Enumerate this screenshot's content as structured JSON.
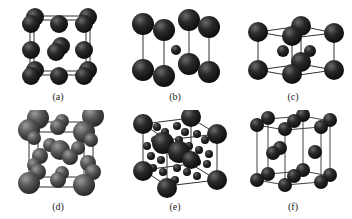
{
  "figure": {
    "panels": [
      {
        "id": "a",
        "label": "(a)",
        "structure": "simple-cubic-like (3x3 sphere grid, face view)"
      },
      {
        "id": "b",
        "label": "(b)",
        "structure": "body-centered tetragonal-like (8 corner + 1 small center)"
      },
      {
        "id": "c",
        "label": "(c)",
        "structure": "layered cell with 2 interior spheres"
      },
      {
        "id": "d",
        "label": "(d)",
        "structure": "face-centered cubic with interstitials (grey spheres)"
      },
      {
        "id": "e",
        "label": "(e)",
        "structure": "complex cubic with many small interstitial spheres"
      },
      {
        "id": "f",
        "label": "(f)",
        "structure": "hexagonal close-packed prism"
      }
    ]
  },
  "colors": {
    "background": "#ffffff",
    "sphere_dark": "#1c1c1c",
    "sphere_highlight": "#5a5a5a",
    "sphere_grey": "#4a4a4a",
    "sphere_grey_highlight": "#8a8a8a",
    "edge": "#333333"
  }
}
